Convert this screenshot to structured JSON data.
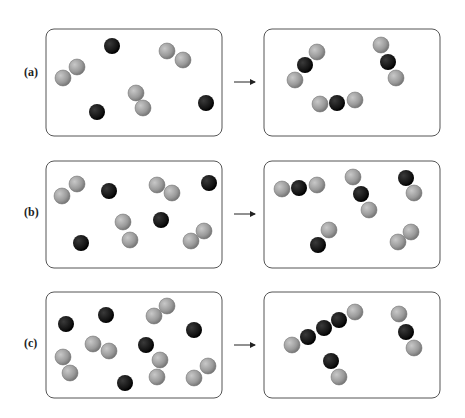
{
  "diagram": {
    "colors": {
      "dark_atom": "#1a1a1a",
      "light_atom": "#9a9a9a",
      "box_border": "#555555"
    },
    "rows": [
      {
        "label": "(a)",
        "before": {
          "dark_atoms": 3,
          "light_diatomics": 3,
          "dark": [
            [
              112,
              46
            ],
            [
              97,
              112
            ],
            [
              206,
              103
            ]
          ],
          "light": [
            [
              77,
              67
            ],
            [
              63,
              78
            ],
            [
              167,
              51
            ],
            [
              183,
              60
            ],
            [
              136,
              93
            ],
            [
              143,
              108
            ]
          ]
        },
        "after": {
          "molecules": 3,
          "description": "3 triatomic molecules: light-dark-light",
          "dark": [
            [
              305,
              65
            ],
            [
              388,
              62
            ],
            [
              337,
              103
            ]
          ],
          "light": [
            [
              317,
              52
            ],
            [
              295,
              80
            ],
            [
              381,
              45
            ],
            [
              396,
              78
            ],
            [
              320,
              104
            ],
            [
              355,
              100
            ]
          ]
        }
      },
      {
        "label": "(b)",
        "before": {
          "dark_atoms": 4,
          "light_diatomics": 4,
          "dark": [
            [
              109,
              191
            ],
            [
              209,
              183
            ],
            [
              161,
              220
            ],
            [
              81,
              243
            ]
          ],
          "light": [
            [
              77,
              184
            ],
            [
              62,
              196
            ],
            [
              157,
              185
            ],
            [
              172,
              193
            ],
            [
              123,
              222
            ],
            [
              130,
              240
            ],
            [
              191,
              241
            ],
            [
              204,
              231
            ]
          ]
        },
        "after": {
          "description": "2 triatomic, 2 diatomic light-dark, 1 light diatomic",
          "dark": [
            [
              299,
              188
            ],
            [
              361,
              194
            ],
            [
              406,
              178
            ],
            [
              318,
              245
            ]
          ],
          "light": [
            [
              282,
              189
            ],
            [
              317,
              185
            ],
            [
              353,
              177
            ],
            [
              369,
              210
            ],
            [
              414,
              193
            ],
            [
              329,
              230
            ],
            [
              398,
              242
            ],
            [
              411,
              232
            ]
          ]
        }
      },
      {
        "label": "(c)",
        "before": {
          "dark_atoms": 5,
          "light_diatomics": 5,
          "dark": [
            [
              66,
              324
            ],
            [
              106,
              315
            ],
            [
              194,
              330
            ],
            [
              146,
              345
            ],
            [
              125,
              383
            ]
          ],
          "light": [
            [
              154,
              316
            ],
            [
              167,
              306
            ],
            [
              93,
              344
            ],
            [
              109,
              351
            ],
            [
              63,
              357
            ],
            [
              70,
              373
            ],
            [
              160,
              360
            ],
            [
              157,
              377
            ],
            [
              194,
              378
            ],
            [
              208,
              366
            ]
          ]
        },
        "after": {
          "description": "chain light-dark-dark-dark-light, triatomic light-dark-light, diatomic dark-light",
          "dark": [
            [
              308,
              337
            ],
            [
              324,
              328
            ],
            [
              339,
              320
            ],
            [
              406,
              332
            ],
            [
              331,
              361
            ]
          ],
          "light": [
            [
              292,
              345
            ],
            [
              355,
              312
            ],
            [
              399,
              314
            ],
            [
              414,
              348
            ],
            [
              339,
              377
            ]
          ]
        }
      }
    ],
    "arrow": "→"
  }
}
